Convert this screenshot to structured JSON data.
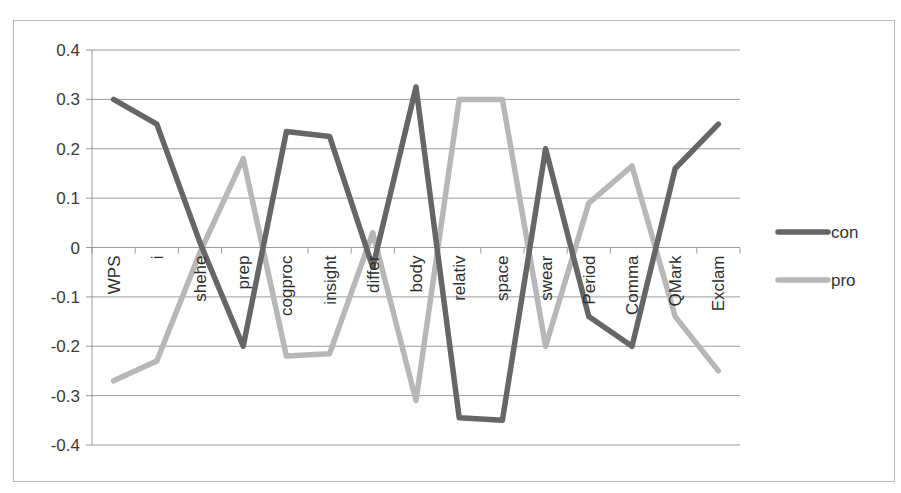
{
  "chart_data": {
    "type": "line",
    "title": "",
    "xlabel": "",
    "ylabel": "",
    "ylim": [
      -0.4,
      0.4
    ],
    "yticks": [
      0.4,
      0.3,
      0.2,
      0.1,
      0,
      -0.1,
      -0.2,
      -0.3,
      -0.4
    ],
    "ytick_labels": [
      "0.4",
      "0.3",
      "0.2",
      "0.1",
      "0",
      "-0.1",
      "-0.2",
      "-0.3",
      "-0.4"
    ],
    "grid": true,
    "legend_position": "right",
    "categories": [
      "WPS",
      "i",
      "shehe",
      "prep",
      "cogproc",
      "insight",
      "differ",
      "body",
      "relativ",
      "space",
      "swear",
      "Period",
      "Comma",
      "QMark",
      "Exclam"
    ],
    "series": [
      {
        "name": "con",
        "color": "#666666",
        "values": [
          0.3,
          0.25,
          0.01,
          -0.2,
          0.235,
          0.225,
          -0.04,
          0.325,
          -0.345,
          -0.35,
          0.2,
          -0.14,
          -0.2,
          0.16,
          0.25
        ]
      },
      {
        "name": "pro",
        "color": "#b7b7b7",
        "values": [
          -0.27,
          -0.23,
          -0.01,
          0.18,
          -0.22,
          -0.215,
          0.03,
          -0.31,
          0.3,
          0.3,
          -0.2,
          0.09,
          0.165,
          -0.14,
          -0.25
        ]
      }
    ]
  },
  "legend": {
    "items": [
      {
        "label": "con",
        "color": "#666666"
      },
      {
        "label": "pro",
        "color": "#b7b7b7"
      }
    ]
  }
}
